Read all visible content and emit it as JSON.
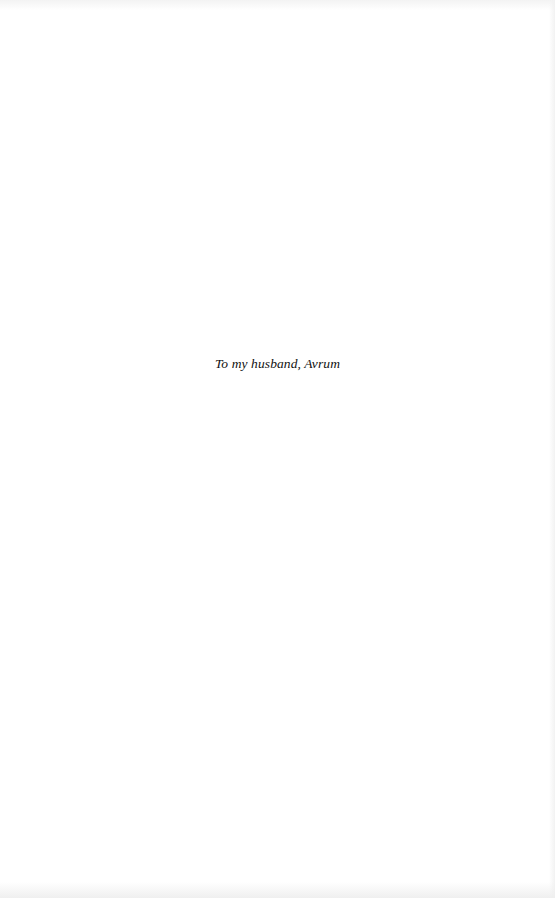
{
  "page": {
    "type": "dedication",
    "dedication_text": "To my husband, Avrum"
  }
}
